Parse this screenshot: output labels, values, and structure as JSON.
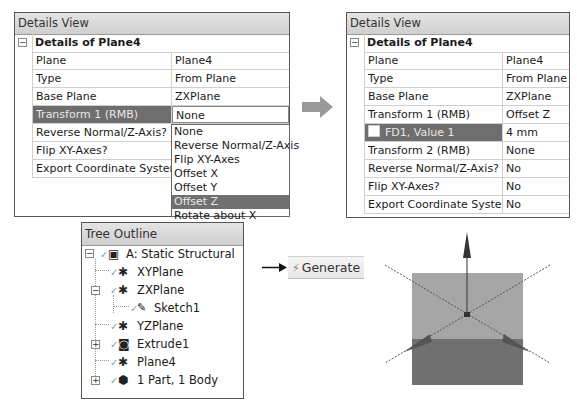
{
  "left_details": {
    "title": "Details View",
    "group": "Details of Plane4",
    "collapse_symbol": "−",
    "rows": [
      {
        "label": "Plane",
        "value": "Plane4"
      },
      {
        "label": "Type",
        "value": "From Plane"
      },
      {
        "label": "Base Plane",
        "value": "ZXPlane"
      },
      {
        "label": "Transform 1 (RMB)",
        "value": "None",
        "selected": true
      },
      {
        "label": "Reverse Normal/Z-Axis?",
        "value": ""
      },
      {
        "label": "Flip XY-Axes?",
        "value": ""
      },
      {
        "label": "Export Coordinate System?",
        "value": ""
      }
    ],
    "dropdown_options": [
      "None",
      "Reverse Normal/Z-Axis",
      "Flip XY-Axes",
      "Offset X",
      "Offset Y",
      "Offset Z",
      "Rotate about X"
    ],
    "dropdown_highlighted": "Offset Z"
  },
  "transition_arrow": "right-arrow-icon",
  "right_details": {
    "title": "Details View",
    "group": "Details of Plane4",
    "collapse_symbol": "−",
    "rows": [
      {
        "label": "Plane",
        "value": "Plane4"
      },
      {
        "label": "Type",
        "value": "From Plane"
      },
      {
        "label": "Base Plane",
        "value": "ZXPlane"
      },
      {
        "label": "Transform 1 (RMB)",
        "value": "Offset Z"
      },
      {
        "label": "FD1, Value 1",
        "value": "4 mm",
        "selected": true,
        "checkbox": true
      },
      {
        "label": "Transform 2 (RMB)",
        "value": "None"
      },
      {
        "label": "Reverse Normal/Z-Axis?",
        "value": "No"
      },
      {
        "label": "Flip XY-Axes?",
        "value": "No"
      },
      {
        "label": "Export Coordinate System?",
        "value": "No"
      }
    ]
  },
  "tree": {
    "title": "Tree Outline",
    "items": [
      {
        "label": "A: Static Structural",
        "icon": "static-structural-icon",
        "expander": "−",
        "level": 0
      },
      {
        "label": "XYPlane",
        "icon": "plane-icon",
        "level": 1
      },
      {
        "label": "ZXPlane",
        "icon": "plane-icon",
        "expander": "−",
        "level": 1
      },
      {
        "label": "Sketch1",
        "icon": "sketch-icon",
        "level": 2
      },
      {
        "label": "YZPlane",
        "icon": "plane-icon",
        "level": 1
      },
      {
        "label": "Extrude1",
        "icon": "extrude-icon",
        "expander": "+",
        "level": 1
      },
      {
        "label": "Plane4",
        "icon": "plane-icon",
        "level": 1
      },
      {
        "label": "1 Part, 1 Body",
        "icon": "body-icon",
        "expander": "+",
        "level": 1
      }
    ]
  },
  "toolbar": {
    "generate_label": "Generate",
    "generate_icon": "⚡"
  },
  "viewport": {
    "box_top_color": "#a6a6a6",
    "box_bottom_color": "#707070",
    "axis_color": "#333333"
  }
}
